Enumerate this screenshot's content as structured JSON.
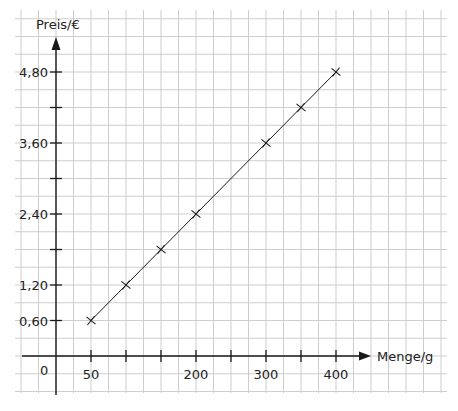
{
  "chart_data": {
    "type": "line",
    "title": "",
    "xlabel": "Menge/g",
    "ylabel": "Preis/€",
    "origin_label": "0",
    "x": [
      50,
      100,
      150,
      200,
      300,
      350,
      400
    ],
    "series": [
      {
        "name": "Preis",
        "values": [
          0.6,
          1.2,
          1.8,
          2.4,
          3.6,
          4.2,
          4.8
        ],
        "marker": "x"
      }
    ],
    "x_ticks": [
      50,
      100,
      150,
      200,
      250,
      300,
      350,
      400
    ],
    "x_tick_labels": {
      "50": "50",
      "200": "200",
      "300": "300",
      "400": "400"
    },
    "y_ticks": [
      0.6,
      1.2,
      1.8,
      2.4,
      3.0,
      3.6,
      4.2,
      4.8
    ],
    "y_tick_labels": {
      "0.6": "0,60",
      "1.2": "1,20",
      "2.4": "2,40",
      "3.6": "3,60",
      "4.8": "4,80"
    },
    "xlim": [
      0,
      400
    ],
    "ylim": [
      0,
      4.8
    ],
    "grid": true,
    "legend": "none",
    "colors": {
      "line": "#1a1a1a",
      "grid": "#cdcdcd",
      "text": "#222222"
    }
  }
}
